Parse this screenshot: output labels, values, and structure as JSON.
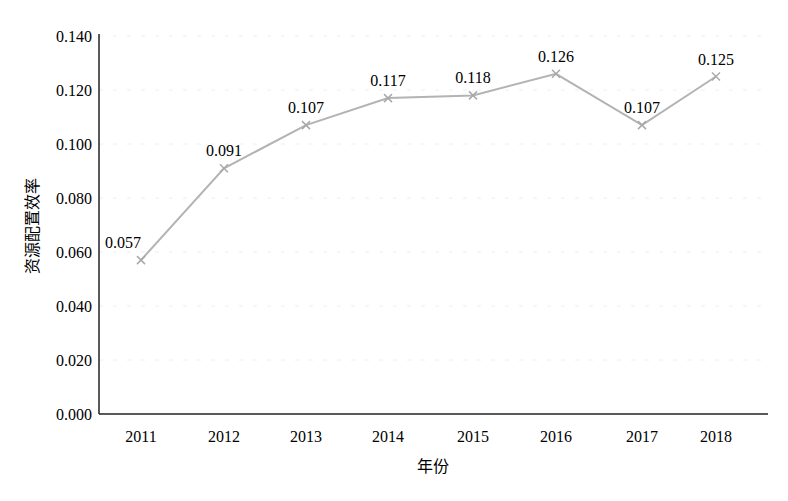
{
  "chart_data": {
    "type": "line",
    "title": "",
    "xlabel": "年份",
    "ylabel": "资源配置效率",
    "categories": [
      "2011",
      "2012",
      "2013",
      "2014",
      "2015",
      "2016",
      "2017",
      "2018"
    ],
    "series": [
      {
        "name": "资源配置效率",
        "values": [
          0.057,
          0.091,
          0.107,
          0.117,
          0.118,
          0.126,
          0.107,
          0.125
        ],
        "color": "#b3b3b3",
        "marker": "x"
      }
    ],
    "data_labels": [
      "0.057",
      "0.091",
      "0.107",
      "0.117",
      "0.118",
      "0.126",
      "0.107",
      "0.125"
    ],
    "yticks": [
      "0.000",
      "0.020",
      "0.040",
      "0.060",
      "0.080",
      "0.100",
      "0.120",
      "0.140"
    ],
    "ylim": [
      0,
      0.14
    ],
    "grid": true,
    "legend": "none"
  }
}
